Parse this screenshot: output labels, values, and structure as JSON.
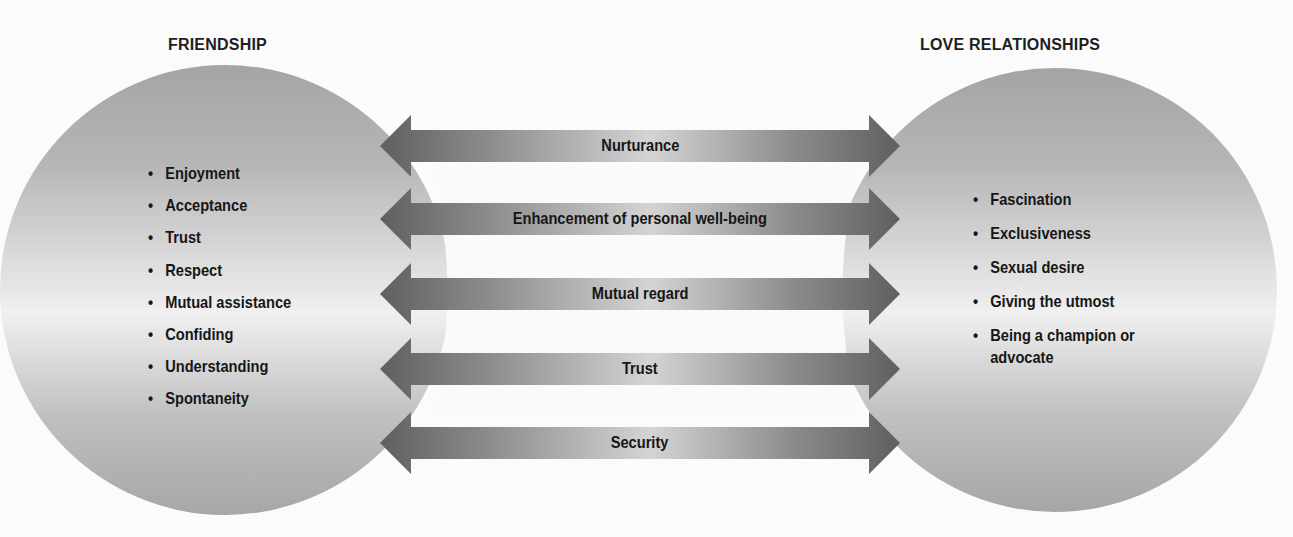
{
  "diagram": {
    "left": {
      "title": "FRIENDSHIP",
      "items": [
        "Enjoyment",
        "Acceptance",
        "Trust",
        "Respect",
        "Mutual assistance",
        "Confiding",
        "Understanding",
        "Spontaneity"
      ]
    },
    "right": {
      "title": "LOVE RELATIONSHIPS",
      "items": [
        "Fascination",
        "Exclusiveness",
        "Sexual desire",
        "Giving the utmost",
        "Being a champion or advocate"
      ]
    },
    "shared": [
      "Nurturance",
      "Enhancement of personal well-being",
      "Mutual regard",
      "Trust",
      "Security"
    ],
    "colors": {
      "circle_dark": "#a4a4a4",
      "circle_light": "#efefef",
      "arrow_dark": "#656565",
      "arrow_light": "#cfcfcf",
      "text": "#161616"
    }
  }
}
